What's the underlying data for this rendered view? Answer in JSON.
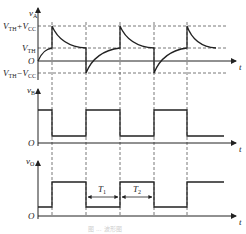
{
  "diagram": {
    "caption": "图 ... 波形图",
    "colors": {
      "line": "#222222",
      "dash": "#555555",
      "caption": "#cfcfcf"
    },
    "panels": [
      {
        "id": "vA",
        "ylabel": {
          "main": "v",
          "sub": "A"
        },
        "xlabel": "t",
        "origin_label": "O",
        "levels": [
          {
            "main": "V",
            "sub": "TH",
            "rest": "+V",
            "sub2": "CC"
          },
          {
            "main": "V",
            "sub": "TH"
          },
          {
            "main": "V",
            "sub": "TH",
            "rest": "−V",
            "sub2": "CC"
          }
        ]
      },
      {
        "id": "vB",
        "ylabel": {
          "main": "v",
          "sub": "B"
        },
        "xlabel": "t",
        "origin_label": "O"
      },
      {
        "id": "vO",
        "ylabel": {
          "main": "v",
          "sub": "O"
        },
        "xlabel": "t",
        "origin_label": "O",
        "intervals": [
          {
            "main": "T",
            "sub": "1"
          },
          {
            "main": "T",
            "sub": "2"
          }
        ]
      }
    ]
  }
}
